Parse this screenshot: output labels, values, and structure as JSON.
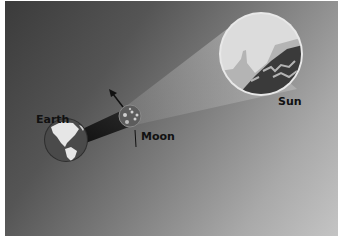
{
  "diagram": {
    "labels": {
      "earth": "Earth",
      "moon": "Moon",
      "sun": "Sun"
    },
    "icons": {
      "sun": "sun-closeup-icon",
      "moon": "moon-icon",
      "earth": "earth-globe-icon",
      "arrow": "orbit-direction-arrow-icon"
    },
    "colors": {
      "background_dark": "#3b3b3b",
      "background_light": "#c4c4c4",
      "sun_border": "#e8e8e8",
      "sun_sky": "#dcdcdc",
      "sun_surface": "#3a3a3a",
      "shadow_cone": "#1a1a1a",
      "light_cone": "#b8b8b8",
      "earth_ocean": "#4a4a4a",
      "earth_land": "#e6e6e6",
      "moon_body": "#6a6a6a",
      "label_text": "#111111"
    }
  }
}
